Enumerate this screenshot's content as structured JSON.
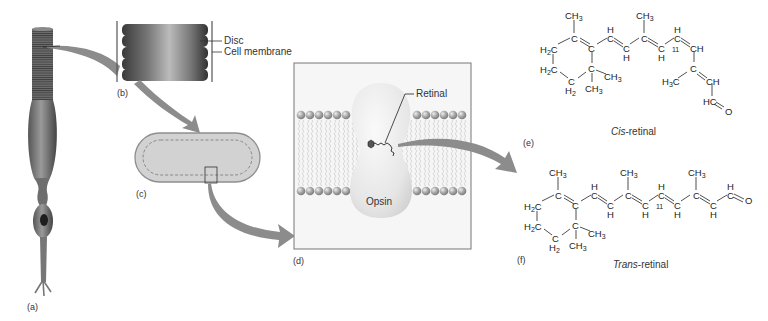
{
  "figure": {
    "panels": [
      {
        "id": "a",
        "label": "(a)",
        "subject": "rod-cell"
      },
      {
        "id": "b",
        "label": "(b)",
        "subject": "disc-stack"
      },
      {
        "id": "c",
        "label": "(c)",
        "subject": "single-disc"
      },
      {
        "id": "d",
        "label": "(d)",
        "subject": "membrane-with-rhodopsin"
      },
      {
        "id": "e",
        "label": "(e)",
        "subject": "cis-retinal"
      },
      {
        "id": "f",
        "label": "(f)",
        "subject": "trans-retinal"
      }
    ],
    "callouts": {
      "disc": "Disc",
      "cell_membrane": "Cell membrane",
      "retinal": "Retinal",
      "opsin": "Opsin"
    },
    "captions": {
      "cis_prefix": "Cis",
      "cis_suffix": "-retinal",
      "trans_prefix": "Trans",
      "trans_suffix": "-retinal"
    },
    "chem": {
      "ch3": "CH",
      "h2c": "H",
      "h": "H",
      "c": "C",
      "ch": "CH",
      "hc": "HC",
      "o": "O",
      "h3c": "H",
      "h2": "H",
      "position_11": "11",
      "sub2": "2",
      "sub3": "3"
    },
    "colors": {
      "arrow": "#8c8c8c",
      "membrane_head": "#a9a9a9",
      "opsin": "#ececec",
      "disc_fill": "#c8c8c8",
      "stack_dark": "#444444",
      "line": "#222222"
    }
  }
}
